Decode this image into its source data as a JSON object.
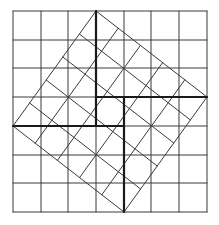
{
  "figure": {
    "title": "",
    "colors": {
      "background": "#ffffff",
      "grid_line": "#3a3a3a",
      "tilted_line": "#3a3a3a",
      "thick_line": "#1a1a1a"
    },
    "outer_grid": {
      "x": [
        13,
        41,
        68,
        96,
        124,
        151,
        179,
        207
      ],
      "y": [
        11,
        40,
        68,
        97,
        126,
        155,
        183,
        212
      ]
    },
    "tilted_square": {
      "vertices": {
        "top": [
          96,
          11
        ],
        "right": [
          207,
          97
        ],
        "bottom": [
          124,
          212
        ],
        "left": [
          13,
          126
        ]
      },
      "divisions": 5
    },
    "thick_segments": [
      [
        96,
        11,
        96,
        126
      ],
      [
        96,
        97,
        207,
        97
      ],
      [
        124,
        97,
        124,
        212
      ],
      [
        13,
        126,
        124,
        126
      ]
    ]
  }
}
